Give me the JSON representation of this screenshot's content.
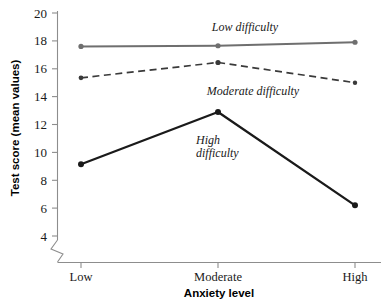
{
  "chart_data": {
    "type": "line",
    "title": "",
    "xlabel": "Anxiety level",
    "ylabel": "Test score (mean values)",
    "categories": [
      "Low",
      "Moderate",
      "High"
    ],
    "ylim": [
      4,
      20
    ],
    "yticks": [
      4,
      6,
      8,
      10,
      12,
      14,
      16,
      18,
      20
    ],
    "ytick_labels": [
      "4",
      "6",
      "8",
      "10",
      "12",
      "14",
      "16",
      "18",
      "20"
    ],
    "grid": false,
    "legend_position": "inline-annotations",
    "axis_break": true,
    "series": [
      {
        "name": "Low difficulty",
        "values": [
          17.6,
          17.65,
          17.9
        ],
        "style": "solid",
        "color": "#6f6f6f",
        "marker": "circle"
      },
      {
        "name": "Moderate difficulty",
        "values": [
          15.35,
          16.45,
          15.0
        ],
        "style": "dashed",
        "color": "#3a3a3a",
        "marker": "circle"
      },
      {
        "name": "High difficulty",
        "values": [
          9.15,
          12.9,
          6.2
        ],
        "style": "solid",
        "color": "#1a1a1a",
        "marker": "circle"
      }
    ],
    "annotations": [
      {
        "text": "Low difficulty",
        "series": "Low difficulty",
        "x_px": 245,
        "y_px": 31
      },
      {
        "text": "Moderate difficulty",
        "series": "Moderate difficulty",
        "x_px": 253,
        "y_px": 95
      },
      {
        "text": "High",
        "series": "High difficulty",
        "x_px": 196,
        "y_px": 144
      },
      {
        "text": "difficulty",
        "series": "High difficulty",
        "x_px": 196,
        "y_px": 157
      }
    ]
  },
  "axes": {
    "y_title": "Test score (mean values)",
    "x_title": "Anxiety level",
    "x_categories": [
      "Low",
      "Moderate",
      "High"
    ],
    "y_tick_labels": [
      "20",
      "18",
      "16",
      "14",
      "12",
      "10",
      "8",
      "6",
      "4"
    ]
  },
  "series_labels": {
    "low": "Low difficulty",
    "moderate": "Moderate difficulty",
    "high_line1": "High",
    "high_line2": "difficulty"
  },
  "colors": {
    "low_difficulty": "#6f6f6f",
    "moderate_difficulty": "#3a3a3a",
    "high_difficulty": "#1a1a1a",
    "axis": "#8d8d8d",
    "text": "#1a1a1a"
  }
}
